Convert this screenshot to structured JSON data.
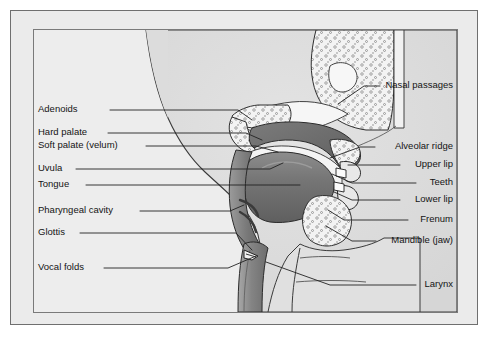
{
  "figure": {
    "frame": {
      "outer_border_color": "#6f6f6f",
      "inner_border_color": "#7a7a7a",
      "page_background": "#ffffff",
      "plate_background": "#ebebeb"
    }
  },
  "palette": {
    "head_fill": "#dedede",
    "outside_fill": "#e4e4e4",
    "bone_fill": "#f2f2f2",
    "bone_stipple": "#6a6a6a",
    "soft_tissue_dark": "#6e6e6e",
    "soft_tissue_mid": "#8e8e8e",
    "soft_tissue_light": "#b5b5b5",
    "cavity_fill": "#f4f4f4",
    "outline": "#2a2a2a",
    "leader_line": "#222222",
    "text": "#141414"
  },
  "labels": {
    "left": [
      {
        "id": "adenoids",
        "text": "Adenoids",
        "text_x": 38,
        "text_y": 113,
        "leader": [
          [
            110,
            110
          ],
          [
            238,
            110
          ],
          [
            252,
            120
          ]
        ]
      },
      {
        "id": "hard-palate",
        "text": "Hard palate",
        "text_x": 38,
        "text_y": 136,
        "leader": [
          [
            108,
            133
          ],
          [
            246,
            133
          ],
          [
            262,
            140
          ]
        ]
      },
      {
        "id": "soft-palate",
        "text": "Soft palate (velum)",
        "text_x": 38,
        "text_y": 149,
        "leader": [
          [
            146,
            146
          ],
          [
            256,
            146
          ],
          [
            278,
            152
          ]
        ]
      },
      {
        "id": "uvula",
        "text": "Uvula",
        "text_x": 38,
        "text_y": 172,
        "leader": [
          [
            76,
            169
          ],
          [
            270,
            169
          ],
          [
            283,
            163
          ]
        ]
      },
      {
        "id": "tongue",
        "text": "Tongue",
        "text_x": 38,
        "text_y": 188,
        "leader": [
          [
            86,
            185
          ],
          [
            300,
            185
          ]
        ]
      },
      {
        "id": "pharyngeal-cavity",
        "text": "Pharyngeal cavity",
        "text_x": 38,
        "text_y": 214,
        "leader": [
          [
            140,
            211
          ],
          [
            230,
            211
          ],
          [
            244,
            205
          ]
        ]
      },
      {
        "id": "glottis",
        "text": "Glottis",
        "text_x": 38,
        "text_y": 236,
        "leader": [
          [
            80,
            233
          ],
          [
            236,
            233
          ],
          [
            252,
            250
          ]
        ]
      },
      {
        "id": "vocal-folds",
        "text": "Vocal folds",
        "text_x": 38,
        "text_y": 271,
        "leader": [
          [
            104,
            268
          ],
          [
            228,
            268
          ],
          [
            256,
            256
          ]
        ]
      }
    ],
    "right": [
      {
        "id": "nasal-passages",
        "text": "Nasal passages",
        "text_x": 453,
        "text_y": 89,
        "leader": [
          [
            380,
            86
          ],
          [
            364,
            86
          ],
          [
            338,
            104
          ]
        ]
      },
      {
        "id": "alveolar-ridge",
        "text": "Alveolar ridge",
        "text_x": 453,
        "text_y": 150,
        "leader": [
          [
            375,
            147
          ],
          [
            360,
            147
          ],
          [
            330,
            158
          ]
        ]
      },
      {
        "id": "upper-lip",
        "text": "Upper lip",
        "text_x": 453,
        "text_y": 168,
        "leader": [
          [
            400,
            165
          ],
          [
            348,
            165
          ]
        ]
      },
      {
        "id": "teeth",
        "text": "Teeth",
        "text_x": 453,
        "text_y": 186,
        "leader": [
          [
            416,
            183
          ],
          [
            352,
            183
          ],
          [
            332,
            174
          ]
        ]
      },
      {
        "id": "lower-lip",
        "text": "Lower lip",
        "text_x": 453,
        "text_y": 203,
        "leader": [
          [
            400,
            200
          ],
          [
            352,
            200
          ],
          [
            334,
            192
          ]
        ]
      },
      {
        "id": "frenum",
        "text": "Frenum",
        "text_x": 453,
        "text_y": 223,
        "leader": [
          [
            408,
            220
          ],
          [
            344,
            220
          ],
          [
            328,
            210
          ]
        ]
      },
      {
        "id": "mandible-jaw",
        "text": "Mandible (jaw)",
        "text_x": 453,
        "text_y": 244,
        "leader": [
          [
            376,
            241
          ],
          [
            352,
            241
          ],
          [
            326,
            226
          ]
        ]
      },
      {
        "id": "larynx",
        "text": "Larynx",
        "text_x": 453,
        "text_y": 288,
        "leader": [
          [
            416,
            285
          ],
          [
            330,
            285
          ],
          [
            266,
            262
          ]
        ]
      }
    ]
  }
}
